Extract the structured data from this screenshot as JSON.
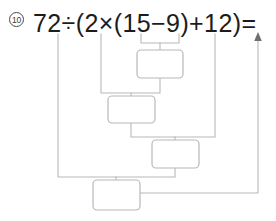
{
  "worksheet": {
    "problem_number": "10",
    "expression": "72÷(2×(15−9)+12)=",
    "expression_tokens": [
      "72",
      "÷",
      "(",
      "2",
      "×",
      "(",
      "15",
      "−",
      "9",
      ")",
      "+",
      "12",
      ")",
      "="
    ],
    "instruction_note": "",
    "answer_boxes": [
      {
        "id": "step-1",
        "label": "",
        "value": "",
        "step_order": "1",
        "source": "15−9"
      },
      {
        "id": "step-2",
        "label": "",
        "value": "",
        "step_order": "2",
        "source": "2×(step-1)"
      },
      {
        "id": "step-3",
        "label": "",
        "value": "",
        "step_order": "3",
        "source": "(step-2)+12"
      },
      {
        "id": "step-4",
        "label": "",
        "value": "",
        "step_order": "4",
        "source": "72÷(step-3)"
      }
    ],
    "colors": {
      "ink": "#1c1c1c",
      "wire": "#b8b8b8",
      "badge": "#4a4a4a",
      "paper": "#ffffff"
    }
  }
}
